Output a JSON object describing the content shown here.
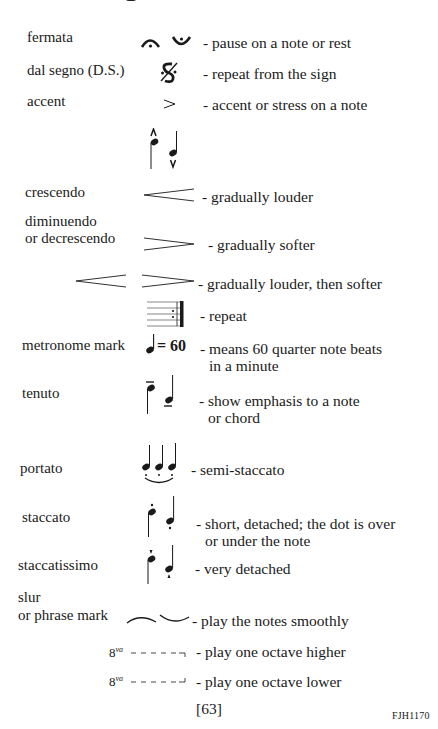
{
  "page": {
    "page_number": "[63]",
    "catalog_code": "FJH1170"
  },
  "entries": [
    {
      "term": "fermata",
      "symbol": "fermata-icon",
      "description": "- pause on a note or rest"
    },
    {
      "term": "dal segno (D.S.)",
      "symbol": "segno-icon",
      "description": "- repeat from the sign"
    },
    {
      "term": "accent",
      "symbol": "accent-icon",
      "description": "- accent or stress on a note"
    },
    {
      "term": "",
      "symbol": "marcato-notes-icon",
      "description": ""
    },
    {
      "term": "crescendo",
      "symbol": "crescendo-hairpin-icon",
      "description": "- gradually louder"
    },
    {
      "term_line1": "diminuendo",
      "term_line2": "or decrescendo",
      "symbol": "diminuendo-hairpin-icon",
      "description": "- gradually softer"
    },
    {
      "term": "",
      "symbol": "cresc-dim-hairpins-icon",
      "description": "- gradually louder, then softer"
    },
    {
      "term": "",
      "symbol": "repeat-barline-icon",
      "description": "- repeat"
    },
    {
      "term": "metronome mark",
      "symbol": "quarter-note-icon",
      "symbol_text": "= 60",
      "description_line1": "- means 60 quarter note beats",
      "description_line2": "in a minute"
    },
    {
      "term": "tenuto",
      "symbol": "tenuto-notes-icon",
      "description_line1": "- show emphasis to a note",
      "description_line2": "or chord"
    },
    {
      "term": "portato",
      "symbol": "portato-notes-icon",
      "description": "- semi-staccato"
    },
    {
      "term": "staccato",
      "symbol": "staccato-notes-icon",
      "description_line1": "- short, detached; the dot is over",
      "description_line2": "or under the note"
    },
    {
      "term": "staccatissimo",
      "symbol": "staccatissimo-notes-icon",
      "description": "- very detached"
    },
    {
      "term_line1": "slur",
      "term_line2": "or phrase mark",
      "symbol": "slur-icon",
      "description": "- play the notes smoothly"
    },
    {
      "term": "",
      "symbol": "ottava-alta-icon",
      "symbol_text": "8",
      "symbol_sup": "va",
      "description": "- play one octave higher"
    },
    {
      "term": "",
      "symbol": "ottava-bassa-icon",
      "symbol_text": "8",
      "symbol_sup": "va",
      "description": "- play one octave lower"
    }
  ]
}
